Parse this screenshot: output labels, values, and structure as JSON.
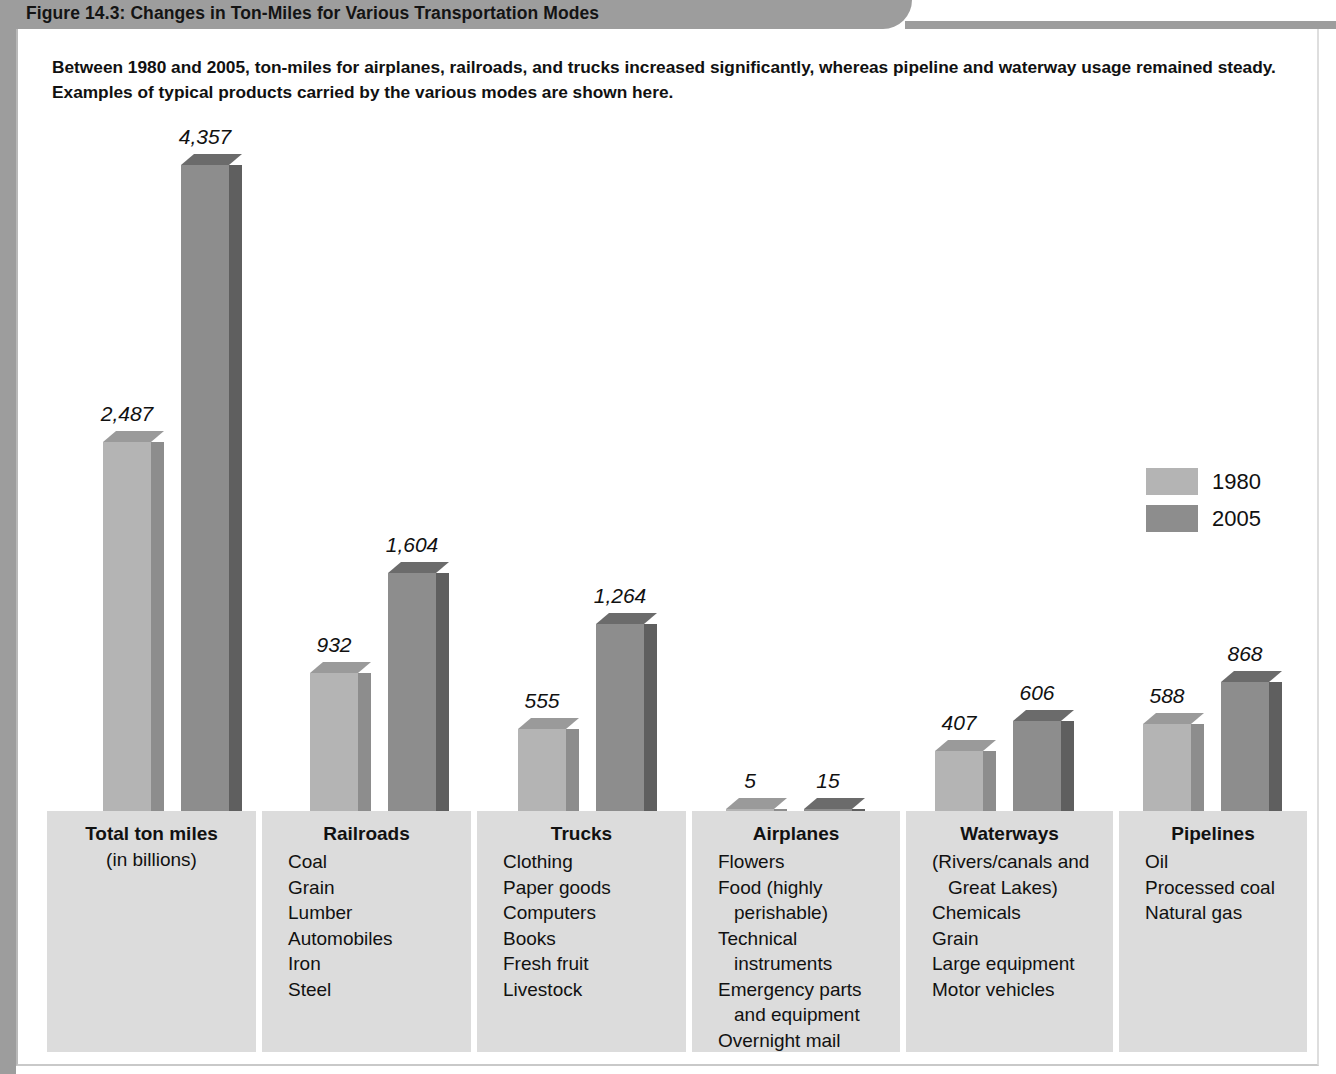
{
  "figure": {
    "title": "Figure 14.3: Changes in Ton-Miles for Various Transportation Modes",
    "caption": "Between 1980 and 2005, ton-miles for airplanes, railroads, and trucks increased significantly, whereas pipeline and waterway usage remained steady. Examples of typical products carried by the various modes are shown here."
  },
  "legend": {
    "items": [
      {
        "label": "1980",
        "color": "#b4b4b4"
      },
      {
        "label": "2005",
        "color": "#8d8d8d"
      }
    ]
  },
  "categories": [
    {
      "title": "Total ton miles",
      "subtitle": "(in billions)",
      "items": []
    },
    {
      "title": "Railroads",
      "subtitle": "",
      "items": [
        "Coal",
        "Grain",
        "Lumber",
        "Automobiles",
        "Iron",
        "Steel"
      ]
    },
    {
      "title": "Trucks",
      "subtitle": "",
      "items": [
        "Clothing",
        "Paper goods",
        "Computers",
        "Books",
        "Fresh fruit",
        "Livestock"
      ]
    },
    {
      "title": "Airplanes",
      "subtitle": "",
      "items": [
        "Flowers",
        "Food (highly perishable)",
        "Technical instruments",
        "Emergency parts and equipment",
        "Overnight mail"
      ]
    },
    {
      "title": "Waterways",
      "subtitle": "",
      "items": [
        "(Rivers/canals and Great Lakes)",
        "Chemicals",
        "Grain",
        "Large equipment",
        "Motor vehicles"
      ]
    },
    {
      "title": "Pipelines",
      "subtitle": "",
      "items": [
        "Oil",
        "Processed coal",
        "Natural gas"
      ]
    }
  ],
  "chart_data": {
    "type": "bar",
    "title": "Figure 14.3: Changes in Ton-Miles for Various Transportation Modes",
    "subtitle": "Between 1980 and 2005, ton-miles for airplanes, railroads, and trucks increased significantly, whereas pipeline and waterway usage remained steady. Examples of typical products carried by the various modes are shown here.",
    "xlabel": "",
    "ylabel": "Ton miles (in billions)",
    "ylim": [
      0,
      4357
    ],
    "grid": false,
    "legend_position": "right",
    "categories": [
      "Total ton miles",
      "Railroads",
      "Trucks",
      "Airplanes",
      "Waterways",
      "Pipelines"
    ],
    "series": [
      {
        "name": "1980",
        "color": "#b4b4b4",
        "values": [
          2487,
          932,
          555,
          5,
          407,
          588
        ]
      },
      {
        "name": "2005",
        "color": "#8d8d8d",
        "values": [
          4357,
          1604,
          1264,
          15,
          606,
          868
        ]
      }
    ],
    "data_labels": {
      "1980": [
        "2,487",
        "932",
        "555",
        "5",
        "407",
        "588"
      ],
      "2005": [
        "4,357",
        "1,604",
        "1,264",
        "15",
        "606",
        "868"
      ]
    }
  }
}
